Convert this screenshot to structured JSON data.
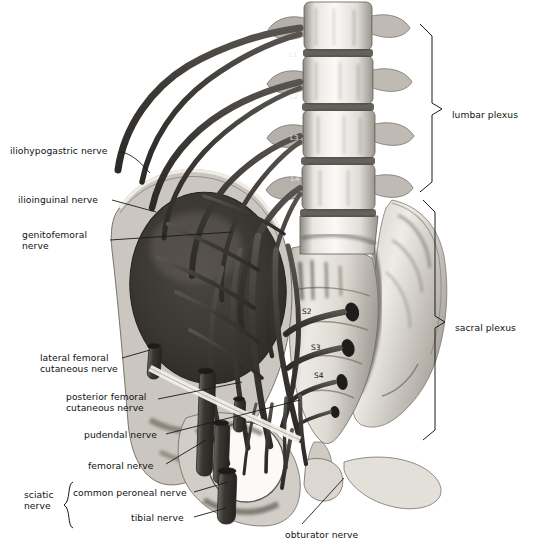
{
  "figure": {
    "background_color": "#ffffff",
    "nerve_color": "#3a3a3a",
    "bone_color": "#d9d6d0",
    "text_color": "#111111"
  },
  "labels_left": [
    {
      "id": "iliohypogastric",
      "text": "iliohypogastric nerve",
      "x": 10,
      "y": 145,
      "lines": 1
    },
    {
      "id": "ilioinguinal",
      "text": "ilioinguinal nerve",
      "x": 18,
      "y": 194,
      "lines": 1
    },
    {
      "id": "genitofemoral",
      "text": "genitofemoral\nnerve",
      "x": 22,
      "y": 229,
      "lines": 2
    },
    {
      "id": "lateral-femoral-cutaneous",
      "text": "lateral femoral\ncutaneous nerve",
      "x": 40,
      "y": 352,
      "lines": 2
    },
    {
      "id": "posterior-femoral-cutaneous",
      "text": "posterior femoral\ncutaneous nerve",
      "x": 66,
      "y": 391,
      "lines": 2
    },
    {
      "id": "pudendal",
      "text": "pudendal nerve",
      "x": 84,
      "y": 429,
      "lines": 1
    },
    {
      "id": "femoral",
      "text": "femoral nerve",
      "x": 88,
      "y": 460,
      "lines": 1
    },
    {
      "id": "common-peroneal",
      "text": "common peroneal nerve",
      "x": 73,
      "y": 487,
      "lines": 1
    },
    {
      "id": "tibial",
      "text": "tibial nerve",
      "x": 131,
      "y": 512,
      "lines": 1
    }
  ],
  "label_sciatic": {
    "id": "sciatic",
    "text": "sciatic\nnerve",
    "x": 24,
    "y": 489
  },
  "label_obturator": {
    "id": "obturator",
    "text": "obturator nerve",
    "x": 285,
    "y": 529
  },
  "labels_right": [
    {
      "id": "lumbar-plexus",
      "text": "lumbar plexus",
      "x": 452,
      "y": 109
    },
    {
      "id": "sacral-plexus",
      "text": "sacral plexus",
      "x": 455,
      "y": 322
    }
  ],
  "root_markers": [
    {
      "text": "L1",
      "x": 289,
      "y": 57
    },
    {
      "text": "L2",
      "x": 290,
      "y": 99
    },
    {
      "text": "L3",
      "x": 290,
      "y": 140
    },
    {
      "text": "L4",
      "x": 291,
      "y": 181
    },
    {
      "text": "S2",
      "x": 302,
      "y": 311
    },
    {
      "text": "S3",
      "x": 311,
      "y": 347
    },
    {
      "text": "S4",
      "x": 314,
      "y": 375
    }
  ],
  "braces": [
    {
      "id": "lumbar-plexus-brace",
      "top": 24,
      "bottom": 192,
      "x": 432,
      "tip_y": 109
    },
    {
      "id": "sacral-plexus-brace",
      "top": 200,
      "bottom": 440,
      "x": 435,
      "tip_y": 322
    }
  ]
}
